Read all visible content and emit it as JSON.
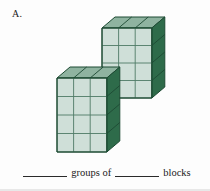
{
  "problem": {
    "label": "A."
  },
  "caption": {
    "blank1": "",
    "word_groups_of": "groups of",
    "blank2": "",
    "word_blocks": "blocks",
    "full_text": "_______ groups of _______ blocks"
  },
  "colors": {
    "front_face": "#cfdfd8",
    "top_face": "#8fb3a0",
    "right_face": "#2e6b4a",
    "outline": "#1d4a33",
    "grid_line": "#4f7a66",
    "background": "#fdfdfd"
  },
  "figure": {
    "type": "block-array-diagram",
    "group_count": 2,
    "blocks_per_group": 12,
    "total_blocks": 24,
    "blocks": [
      {
        "name": "upper-block",
        "columns": 3,
        "rows": 4,
        "origin_x": 102,
        "origin_y": 28,
        "cell_w": 16.6,
        "cell_h": 17.5,
        "depth_x": 13,
        "depth_y": -11
      },
      {
        "name": "lower-block",
        "columns": 3,
        "rows": 4,
        "origin_x": 57,
        "origin_y": 78,
        "cell_w": 16.6,
        "cell_h": 18.5,
        "depth_x": 13,
        "depth_y": -11
      }
    ]
  }
}
